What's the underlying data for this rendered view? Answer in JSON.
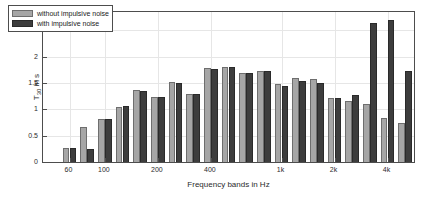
{
  "chart_data": {
    "type": "bar",
    "title": "",
    "xlabel": "Frequency bands in Hz",
    "ylabel": "T30 in s",
    "ylabel_base": "T",
    "ylabel_sub": "30",
    "ylabel_suffix": " in s",
    "ylim": [
      0,
      2.85
    ],
    "yticks": [
      0,
      0.5,
      1,
      1.5,
      2,
      2.5
    ],
    "ytick_labels": [
      "0",
      "0.5",
      "1",
      "1.5",
      "2",
      "2.5"
    ],
    "grid": true,
    "legend_position": "top-left",
    "categories": [
      "50",
      "63",
      "80",
      "100",
      "125",
      "160",
      "200",
      "250",
      "315",
      "400",
      "500",
      "630",
      "800",
      "1k",
      "1.25k",
      "1.6k",
      "2k",
      "2.5k",
      "3.15k",
      "4k",
      "5k"
    ],
    "xtick_labels": [
      "60",
      "100",
      "200",
      "400",
      "1k",
      "2k",
      "4k"
    ],
    "xtick_indices": [
      1,
      3,
      6,
      9,
      13,
      16,
      19
    ],
    "series": [
      {
        "name": "without impulsive noise",
        "color": "#a6a6a6",
        "values": [
          0.0,
          0.27,
          0.67,
          0.81,
          1.05,
          1.37,
          1.24,
          1.52,
          1.29,
          1.78,
          1.8,
          1.7,
          1.73,
          1.49,
          1.59,
          1.57,
          1.21,
          1.16,
          1.1,
          0.84,
          0.74
        ]
      },
      {
        "name": "with impulsive noise",
        "color": "#3d3d3d",
        "values": [
          0.0,
          0.27,
          0.25,
          0.81,
          1.06,
          1.34,
          1.24,
          1.51,
          1.3,
          1.77,
          1.8,
          1.7,
          1.73,
          1.45,
          1.53,
          1.51,
          1.21,
          1.28,
          2.64,
          2.7,
          1.72
        ]
      }
    ]
  },
  "legend": {
    "items": [
      {
        "label": "without impulsive noise"
      },
      {
        "label": "with impulsive noise"
      }
    ]
  }
}
